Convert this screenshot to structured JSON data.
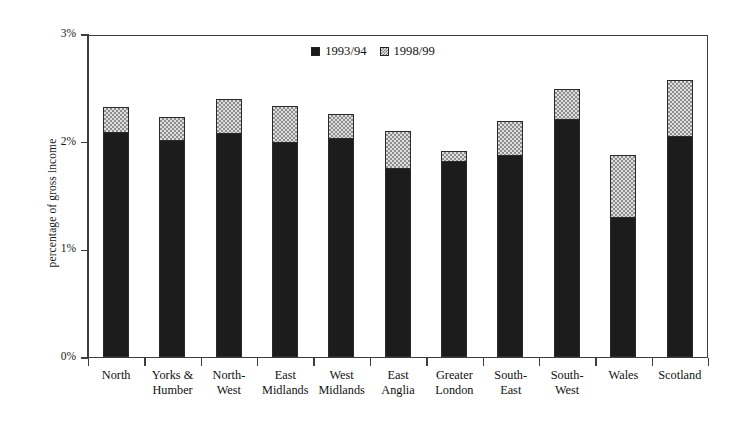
{
  "chart_data": {
    "type": "bar",
    "subtype": "stacked",
    "title": "",
    "xlabel": "",
    "ylabel": "percentage of gross income",
    "ylim": [
      0,
      3
    ],
    "ytick_labels": [
      "0%",
      "1%",
      "2%",
      "3%"
    ],
    "ytick_values": [
      0,
      1,
      2,
      3
    ],
    "grid": false,
    "legend_position": "top-center",
    "categories": [
      "North",
      "Yorks & Humber",
      "North-West",
      "East Midlands",
      "West Midlands",
      "East Anglia",
      "Greater London",
      "South-East",
      "South-West",
      "Wales",
      "Scotland"
    ],
    "category_lines": [
      [
        "North",
        ""
      ],
      [
        "Yorks &",
        "Humber"
      ],
      [
        "North-",
        "West"
      ],
      [
        "East",
        "Midlands"
      ],
      [
        "West",
        "Midlands"
      ],
      [
        "East",
        "Anglia"
      ],
      [
        "Greater",
        "London"
      ],
      [
        "South-",
        "East"
      ],
      [
        "South-",
        "West"
      ],
      [
        "Wales",
        ""
      ],
      [
        "Scotland",
        ""
      ]
    ],
    "series": [
      {
        "name": "1993/94",
        "color": "#1c1c1c",
        "pattern": "solid-dark",
        "values": [
          2.09,
          2.02,
          2.08,
          2.0,
          2.03,
          1.76,
          1.82,
          1.88,
          2.21,
          1.3,
          2.05
        ]
      },
      {
        "name": "1998/99",
        "color": "#dedede",
        "pattern": "checker-light",
        "values": [
          0.23,
          0.21,
          0.32,
          0.33,
          0.23,
          0.34,
          0.09,
          0.31,
          0.28,
          0.58,
          0.52
        ]
      }
    ],
    "totals": [
      2.32,
      2.23,
      2.4,
      2.33,
      2.26,
      2.1,
      1.91,
      2.19,
      2.49,
      1.88,
      2.57
    ]
  },
  "legend": {
    "items": [
      {
        "label": "1993/94",
        "swatch": "dark-square-icon"
      },
      {
        "label": "1998/99",
        "swatch": "checkered-square-icon"
      }
    ]
  },
  "axes": {
    "y_title": "percentage of gross income"
  }
}
